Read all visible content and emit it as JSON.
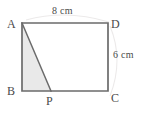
{
  "figure": {
    "type": "geometry-diagram",
    "shape": "rectangle-with-inscribed-shaded-triangle",
    "background_color": "#ffffff",
    "stroke_color": "#6b6b6b",
    "text_color": "#4a4a4a",
    "shaded_fill_color": "#e9e9e9",
    "vertices": [
      {
        "name": "A",
        "label": "A",
        "x": 22,
        "y": 23,
        "position": "top-left"
      },
      {
        "name": "D",
        "label": "D",
        "x": 108,
        "y": 23,
        "position": "top-right"
      },
      {
        "name": "C",
        "label": "C",
        "x": 108,
        "y": 91,
        "position": "bottom-right"
      },
      {
        "name": "B",
        "label": "B",
        "x": 22,
        "y": 91,
        "position": "bottom-left"
      },
      {
        "name": "P",
        "label": "P",
        "x": 51,
        "y": 91,
        "position": "bottom-edge-point"
      }
    ],
    "measures": [
      {
        "name": "width",
        "label": "8 cm",
        "value": 8,
        "unit": "cm",
        "side": "AD",
        "placement": "top"
      },
      {
        "name": "height",
        "label": "6 cm",
        "value": 6,
        "unit": "cm",
        "side": "DC",
        "placement": "right"
      }
    ],
    "shaded_region": {
      "name": "triangle-ABP",
      "vertices": [
        "A",
        "B",
        "P"
      ]
    }
  }
}
